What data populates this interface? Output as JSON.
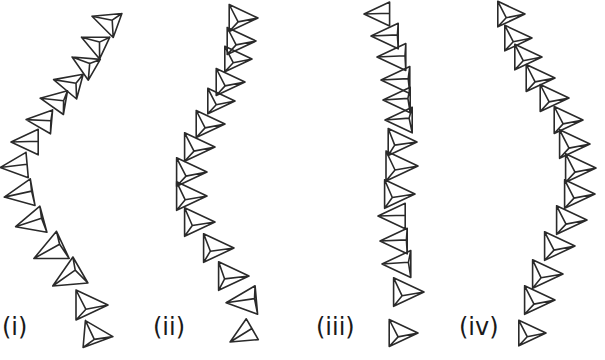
{
  "figure": {
    "panels": [
      {
        "label": "(i)",
        "label_pos": [
          2,
          335
        ],
        "tetrahedra": [
          {
            "c": [
              108,
              22
            ],
            "r": 17,
            "rot": 200,
            "tilt": 0.55
          },
          {
            "c": [
              96,
              44
            ],
            "r": 16,
            "rot": 205,
            "tilt": 0.5
          },
          {
            "c": [
              86,
              65
            ],
            "r": 16,
            "rot": 210,
            "tilt": 0.5
          },
          {
            "c": [
              70,
              84
            ],
            "r": 17,
            "rot": 195,
            "tilt": 0.7
          },
          {
            "c": [
              56,
              101
            ],
            "r": 16,
            "rot": 190,
            "tilt": 0.85
          },
          {
            "c": [
              42,
              121
            ],
            "r": 16,
            "rot": 185,
            "tilt": 0.95
          },
          {
            "c": [
              28,
              142
            ],
            "r": 17,
            "rot": 180,
            "tilt": 1.0
          },
          {
            "c": [
              17,
              166
            ],
            "r": 17,
            "rot": 175,
            "tilt": 1.0
          },
          {
            "c": [
              22,
              194
            ],
            "r": 18,
            "rot": 170,
            "tilt": 0.95
          },
          {
            "c": [
              33,
              222
            ],
            "r": 18,
            "rot": 165,
            "tilt": 0.9
          },
          {
            "c": [
              52,
              250
            ],
            "r": 20,
            "rot": 155,
            "tilt": 0.85
          },
          {
            "c": [
              70,
              276
            ],
            "r": 20,
            "rot": 150,
            "tilt": 0.75
          },
          {
            "c": [
              88,
              305
            ],
            "r": 20,
            "rot": 0,
            "tilt": 0.45
          },
          {
            "c": [
              95,
              335
            ],
            "r": 18,
            "rot": 5,
            "tilt": 0.35
          }
        ]
      },
      {
        "label": "(ii)",
        "label_pos": [
          153,
          335
        ],
        "tetrahedra": [
          {
            "c": [
              240,
              18
            ],
            "r": 18,
            "rot": 0,
            "tilt": 0.45
          },
          {
            "c": [
              238,
              41
            ],
            "r": 18,
            "rot": 0,
            "tilt": 0.45
          },
          {
            "c": [
              235,
              59
            ],
            "r": 17,
            "rot": 0,
            "tilt": 0.45
          },
          {
            "c": [
              227,
              82
            ],
            "r": 18,
            "rot": 0,
            "tilt": 0.45
          },
          {
            "c": [
              218,
              101
            ],
            "r": 17,
            "rot": 0,
            "tilt": 0.45
          },
          {
            "c": [
              207,
              124
            ],
            "r": 18,
            "rot": 0,
            "tilt": 0.45
          },
          {
            "c": [
              196,
              147
            ],
            "r": 19,
            "rot": 0,
            "tilt": 0.45
          },
          {
            "c": [
              188,
              172
            ],
            "r": 19,
            "rot": 0,
            "tilt": 0.45
          },
          {
            "c": [
              188,
              196
            ],
            "r": 19,
            "rot": 0,
            "tilt": 0.5
          },
          {
            "c": [
              196,
              222
            ],
            "r": 19,
            "rot": 0,
            "tilt": 0.55
          },
          {
            "c": [
              215,
              248
            ],
            "r": 19,
            "rot": 0,
            "tilt": 0.6
          },
          {
            "c": [
              230,
              276
            ],
            "r": 19,
            "rot": 0,
            "tilt": 0.65
          },
          {
            "c": [
              245,
              301
            ],
            "r": 19,
            "rot": 175,
            "tilt": 0.9
          },
          {
            "c": [
              244,
              334
            ],
            "r": 16,
            "rot": 150,
            "tilt": 1.0
          }
        ]
      },
      {
        "label": "(iii)",
        "label_pos": [
          316,
          335
        ],
        "tetrahedra": [
          {
            "c": [
              380,
              14
            ],
            "r": 16,
            "rot": 180,
            "tilt": 1.0
          },
          {
            "c": [
              388,
              36
            ],
            "r": 17,
            "rot": 180,
            "tilt": 0.95
          },
          {
            "c": [
              395,
              57
            ],
            "r": 18,
            "rot": 180,
            "tilt": 0.95
          },
          {
            "c": [
              399,
              80
            ],
            "r": 18,
            "rot": 180,
            "tilt": 0.9
          },
          {
            "c": [
              400,
              100
            ],
            "r": 17,
            "rot": 180,
            "tilt": 0.85
          },
          {
            "c": [
              402,
              120
            ],
            "r": 17,
            "rot": 180,
            "tilt": 0.8
          },
          {
            "c": [
              399,
              142
            ],
            "r": 18,
            "rot": 0,
            "tilt": 0.6
          },
          {
            "c": [
              398,
              166
            ],
            "r": 20,
            "rot": 0,
            "tilt": 0.5
          },
          {
            "c": [
              396,
              194
            ],
            "r": 19,
            "rot": 0,
            "tilt": 0.55
          },
          {
            "c": [
              395,
              216
            ],
            "r": 17,
            "rot": 180,
            "tilt": 1.0
          },
          {
            "c": [
              397,
              241
            ],
            "r": 17,
            "rot": 180,
            "tilt": 0.95
          },
          {
            "c": [
              400,
              264
            ],
            "r": 18,
            "rot": 180,
            "tilt": 0.85
          },
          {
            "c": [
              405,
              292
            ],
            "r": 19,
            "rot": 0,
            "tilt": 0.5
          },
          {
            "c": [
              400,
              333
            ],
            "r": 18,
            "rot": 0,
            "tilt": 0.45
          }
        ]
      },
      {
        "label": "(iv)",
        "label_pos": [
          459,
          335
        ],
        "tetrahedra": [
          {
            "c": [
              508,
              14
            ],
            "r": 17,
            "rot": 0,
            "tilt": 0.45
          },
          {
            "c": [
              515,
              38
            ],
            "r": 17,
            "rot": 0,
            "tilt": 0.45
          },
          {
            "c": [
              525,
              57
            ],
            "r": 17,
            "rot": 0,
            "tilt": 0.45
          },
          {
            "c": [
              537,
              78
            ],
            "r": 18,
            "rot": 0,
            "tilt": 0.45
          },
          {
            "c": [
              551,
              98
            ],
            "r": 18,
            "rot": 0,
            "tilt": 0.45
          },
          {
            "c": [
              565,
              120
            ],
            "r": 18,
            "rot": 0,
            "tilt": 0.45
          },
          {
            "c": [
              571,
              144
            ],
            "r": 19,
            "rot": 0,
            "tilt": 0.45
          },
          {
            "c": [
              577,
              168
            ],
            "r": 19,
            "rot": 0,
            "tilt": 0.45
          },
          {
            "c": [
              576,
              194
            ],
            "r": 19,
            "rot": 0,
            "tilt": 0.45
          },
          {
            "c": [
              568,
              220
            ],
            "r": 19,
            "rot": 0,
            "tilt": 0.45
          },
          {
            "c": [
              556,
              246
            ],
            "r": 19,
            "rot": 0,
            "tilt": 0.45
          },
          {
            "c": [
              544,
              274
            ],
            "r": 19,
            "rot": 0,
            "tilt": 0.5
          },
          {
            "c": [
              536,
              300
            ],
            "r": 19,
            "rot": 0,
            "tilt": 0.45
          },
          {
            "c": [
              529,
              333
            ],
            "r": 17,
            "rot": 0,
            "tilt": 0.45
          }
        ]
      }
    ]
  },
  "colors": {
    "stroke": "#2a2a2a",
    "background": "#ffffff",
    "label": "#1a1a1a"
  }
}
